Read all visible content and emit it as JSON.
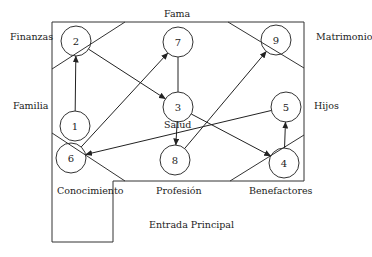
{
  "diagram": {
    "areas": [
      {
        "label": "Fama",
        "x": 164,
        "y": 8
      },
      {
        "label": "Finanzas",
        "x": 10,
        "y": 31
      },
      {
        "label": "Matrimonio",
        "x": 316,
        "y": 31
      },
      {
        "label": "Familia",
        "x": 13,
        "y": 100
      },
      {
        "label": "Hijos",
        "x": 314,
        "y": 100
      },
      {
        "label": "Salud",
        "x": 164,
        "y": 46
      },
      {
        "label": "Conocimiento",
        "x": 57,
        "y": 185
      },
      {
        "label": "Profesión",
        "x": 156,
        "y": 185
      },
      {
        "label": "Benefactores",
        "x": 249,
        "y": 185
      },
      {
        "label": "Entrada Principal",
        "x": 149,
        "y": 219
      }
    ],
    "nodes": [
      {
        "id": "1",
        "cx": 75,
        "cy": 126
      },
      {
        "id": "2",
        "cx": 76,
        "cy": 41
      },
      {
        "id": "3",
        "cx": 178,
        "cy": 107
      },
      {
        "id": "4",
        "cx": 284,
        "cy": 163
      },
      {
        "id": "5",
        "cx": 286,
        "cy": 107
      },
      {
        "id": "6",
        "cx": 71,
        "cy": 158
      },
      {
        "id": "7",
        "cx": 178,
        "cy": 42
      },
      {
        "id": "8",
        "cx": 175,
        "cy": 160
      },
      {
        "id": "9",
        "cx": 276,
        "cy": 40
      }
    ],
    "edges": [
      {
        "from": "1",
        "to": "2",
        "arrow": true
      },
      {
        "from": "2",
        "to": "3",
        "arrow": true
      },
      {
        "from": "6",
        "to": "7",
        "arrow": true
      },
      {
        "from": "7",
        "to": "3",
        "arrow": false
      },
      {
        "from": "3",
        "to": "8",
        "arrow": true
      },
      {
        "from": "8",
        "to": "9",
        "arrow": true
      },
      {
        "from": "5",
        "to": "6",
        "arrow": true
      },
      {
        "from": "3",
        "to": "4",
        "arrow": true
      },
      {
        "from": "4",
        "to": "5",
        "arrow": true
      }
    ]
  }
}
